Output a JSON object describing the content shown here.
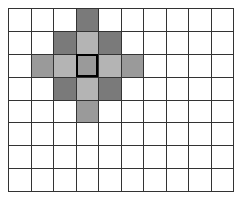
{
  "grid": {
    "rows": 8,
    "cols": 10,
    "colors": {
      "dark": "#7a7a7a",
      "medium": "#9a9a9a",
      "light": "#b4b4b4",
      "empty": "#ffffff",
      "line": "#333333"
    },
    "center": {
      "row": 2,
      "col": 3
    },
    "shaded_cells": [
      {
        "row": 0,
        "col": 3,
        "shade": "dark"
      },
      {
        "row": 1,
        "col": 2,
        "shade": "dark"
      },
      {
        "row": 1,
        "col": 3,
        "shade": "light"
      },
      {
        "row": 1,
        "col": 4,
        "shade": "dark"
      },
      {
        "row": 2,
        "col": 1,
        "shade": "medium"
      },
      {
        "row": 2,
        "col": 2,
        "shade": "light"
      },
      {
        "row": 2,
        "col": 3,
        "shade": "medium"
      },
      {
        "row": 2,
        "col": 4,
        "shade": "light"
      },
      {
        "row": 2,
        "col": 5,
        "shade": "medium"
      },
      {
        "row": 3,
        "col": 2,
        "shade": "dark"
      },
      {
        "row": 3,
        "col": 3,
        "shade": "light"
      },
      {
        "row": 3,
        "col": 4,
        "shade": "dark"
      },
      {
        "row": 4,
        "col": 3,
        "shade": "medium"
      }
    ]
  }
}
